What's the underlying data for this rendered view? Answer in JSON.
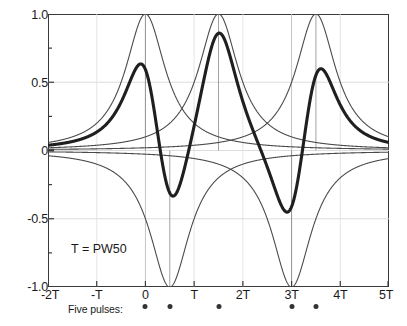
{
  "figure": {
    "annotation": "T = PW50",
    "pulse_row_label": "Five pulses:"
  },
  "chart_data": {
    "type": "line",
    "title": "",
    "xlabel": "",
    "ylabel": "",
    "xlim": [
      -2,
      5
    ],
    "ylim": [
      -1.0,
      1.0
    ],
    "grid": true,
    "legend": "none",
    "annotations": [
      {
        "text": "T = PW50",
        "x": -0.55,
        "y": -0.72
      },
      {
        "text": "Five pulses:",
        "x": -1.45,
        "y": -1.15
      }
    ],
    "xtick_labels": [
      "-2T",
      "-T",
      "0",
      "T",
      "2T",
      "3T",
      "4T",
      "5T"
    ],
    "xtick_values": [
      -2,
      -1,
      0,
      1,
      2,
      3,
      4,
      5
    ],
    "ytick_labels": [
      "1.0",
      "0.5",
      "0",
      "-0.5",
      "-1.0"
    ],
    "ytick_values": [
      1.0,
      0.5,
      0,
      -0.5,
      -1.0
    ],
    "x_units": "T (= PW50)",
    "pulse_shape": "lorentzian",
    "pulse_halfwidth_T": 0.5,
    "pulses": [
      {
        "index": 1,
        "center_T": 0.0,
        "amplitude": 1.0,
        "polarity": "+"
      },
      {
        "index": 2,
        "center_T": 0.5,
        "amplitude": -1.0,
        "polarity": "-"
      },
      {
        "index": 3,
        "center_T": 1.5,
        "amplitude": 1.0,
        "polarity": "+"
      },
      {
        "index": 4,
        "center_T": 3.0,
        "amplitude": -1.0,
        "polarity": "-"
      },
      {
        "index": 5,
        "center_T": 3.5,
        "amplitude": 1.0,
        "polarity": "+"
      }
    ],
    "pulse_marker_positions_T": [
      0.0,
      0.5,
      1.5,
      3.0,
      3.5
    ],
    "series": [
      {
        "name": "pulse-1",
        "kind": "individual-pulse",
        "center_T": 0.0,
        "peak": 1.0,
        "width": "thin"
      },
      {
        "name": "pulse-2",
        "kind": "individual-pulse",
        "center_T": 0.5,
        "peak": -1.0,
        "width": "thin"
      },
      {
        "name": "pulse-3",
        "kind": "individual-pulse",
        "center_T": 1.5,
        "peak": 1.0,
        "width": "thin"
      },
      {
        "name": "pulse-4",
        "kind": "individual-pulse",
        "center_T": 3.0,
        "peak": -1.0,
        "width": "thin"
      },
      {
        "name": "pulse-5",
        "kind": "individual-pulse",
        "center_T": 3.5,
        "peak": 1.0,
        "width": "thin"
      },
      {
        "name": "sum-readback",
        "kind": "sum",
        "width": "thick",
        "local_extrema": [
          {
            "x_T": -0.07,
            "y": 0.63
          },
          {
            "x_T": 0.52,
            "y": -0.34
          },
          {
            "x_T": 1.5,
            "y": 0.87
          },
          {
            "x_T": 3.02,
            "y": -0.45
          },
          {
            "x_T": 3.56,
            "y": 0.59
          }
        ]
      }
    ]
  },
  "style": {
    "curve_color": "#4a4a4a",
    "sum_color": "#1f1f1f",
    "frame_color": "#3a3a3a",
    "grid_color": "#d8d8d8",
    "background": "#ffffff"
  }
}
